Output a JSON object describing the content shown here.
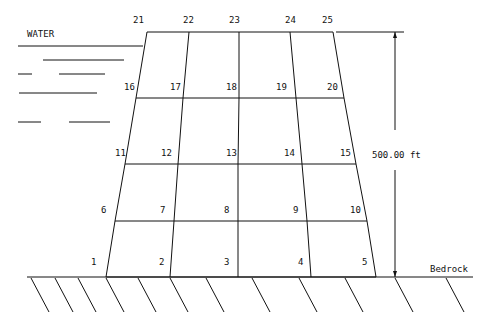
{
  "labels": {
    "water": "WATER",
    "bedrock": "Bedrock",
    "height_dimension": "500.00 ft"
  },
  "colors": {
    "line": "#111111",
    "background": "#ffffff"
  },
  "geometry": {
    "rows_y": [
      277,
      221,
      164,
      98,
      32
    ],
    "nodes": [
      {
        "id": "1",
        "x": 106,
        "y": 277
      },
      {
        "id": "2",
        "x": 170,
        "y": 277
      },
      {
        "id": "3",
        "x": 238,
        "y": 277
      },
      {
        "id": "4",
        "x": 311,
        "y": 277
      },
      {
        "id": "5",
        "x": 376,
        "y": 277
      },
      {
        "id": "6",
        "x": 115,
        "y": 221
      },
      {
        "id": "7",
        "x": 174,
        "y": 221
      },
      {
        "id": "8",
        "x": 238,
        "y": 221
      },
      {
        "id": "9",
        "x": 307,
        "y": 221
      },
      {
        "id": "10",
        "x": 367,
        "y": 221
      },
      {
        "id": "11",
        "x": 125,
        "y": 164
      },
      {
        "id": "12",
        "x": 178,
        "y": 164
      },
      {
        "id": "13",
        "x": 238,
        "y": 164
      },
      {
        "id": "14",
        "x": 302,
        "y": 164
      },
      {
        "id": "15",
        "x": 356,
        "y": 164
      },
      {
        "id": "16",
        "x": 136,
        "y": 98
      },
      {
        "id": "17",
        "x": 183,
        "y": 98
      },
      {
        "id": "18",
        "x": 239,
        "y": 98
      },
      {
        "id": "19",
        "x": 296,
        "y": 98
      },
      {
        "id": "20",
        "x": 344,
        "y": 98
      },
      {
        "id": "21",
        "x": 147,
        "y": 32
      },
      {
        "id": "22",
        "x": 189,
        "y": 32
      },
      {
        "id": "23",
        "x": 239,
        "y": 32
      },
      {
        "id": "24",
        "x": 290,
        "y": 32
      },
      {
        "id": "25",
        "x": 333,
        "y": 32
      }
    ],
    "node_labels": [
      {
        "text": "1",
        "x": 91,
        "y": 265
      },
      {
        "text": "2",
        "x": 159,
        "y": 265
      },
      {
        "text": "3",
        "x": 224,
        "y": 265
      },
      {
        "text": "4",
        "x": 298,
        "y": 265
      },
      {
        "text": "5",
        "x": 362,
        "y": 265
      },
      {
        "text": "6",
        "x": 101,
        "y": 213
      },
      {
        "text": "7",
        "x": 160,
        "y": 213
      },
      {
        "text": "8",
        "x": 224,
        "y": 213
      },
      {
        "text": "9",
        "x": 293,
        "y": 213
      },
      {
        "text": "10",
        "x": 350,
        "y": 213
      },
      {
        "text": "11",
        "x": 115,
        "y": 156
      },
      {
        "text": "12",
        "x": 161,
        "y": 156
      },
      {
        "text": "13",
        "x": 226,
        "y": 156
      },
      {
        "text": "14",
        "x": 284,
        "y": 156
      },
      {
        "text": "15",
        "x": 340,
        "y": 156
      },
      {
        "text": "16",
        "x": 124,
        "y": 90
      },
      {
        "text": "17",
        "x": 170,
        "y": 90
      },
      {
        "text": "18",
        "x": 226,
        "y": 90
      },
      {
        "text": "19",
        "x": 276,
        "y": 90
      },
      {
        "text": "20",
        "x": 327,
        "y": 90
      },
      {
        "text": "21",
        "x": 133,
        "y": 23
      },
      {
        "text": "22",
        "x": 183,
        "y": 23
      },
      {
        "text": "23",
        "x": 229,
        "y": 23
      },
      {
        "text": "24",
        "x": 285,
        "y": 23
      },
      {
        "text": "25",
        "x": 322,
        "y": 23
      }
    ],
    "water_lines": [
      [
        18,
        46,
        143,
        46
      ],
      [
        43,
        60,
        124,
        60
      ],
      [
        18,
        74,
        32,
        74
      ],
      [
        59,
        74,
        105,
        74
      ],
      [
        19,
        93,
        97,
        93
      ],
      [
        18,
        122,
        41,
        122
      ],
      [
        69,
        122,
        110,
        122
      ]
    ],
    "ground_line": [
      27,
      277,
      473,
      277
    ],
    "hatches": [
      31,
      55,
      78,
      106,
      138,
      170,
      206,
      252,
      299,
      345,
      395,
      446
    ],
    "dimension": {
      "x": 395,
      "y_top": 32,
      "y_bottom": 277,
      "tick_x1": 336,
      "tick_x2": 404,
      "gap_top": 130,
      "gap_bottom": 170,
      "label_x": 372,
      "label_y": 158
    },
    "water_label_pos": {
      "x": 27,
      "y": 37
    },
    "bedrock_label_pos": {
      "x": 430,
      "y": 272
    }
  }
}
